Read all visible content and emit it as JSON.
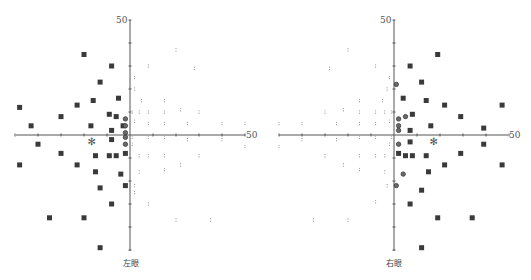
{
  "chart_data": [
    {
      "type": "scatter",
      "title": "左眼",
      "axis_max_label": "50",
      "xlim": [
        -50,
        50
      ],
      "ylim": [
        -50,
        50
      ],
      "grid": false,
      "tick_step": 10,
      "series": [
        {
          "name": "defect (filled square)",
          "marker": "square",
          "points": [
            [
              -20,
              35
            ],
            [
              -8,
              30
            ],
            [
              -13,
              23
            ],
            [
              -16,
              15
            ],
            [
              -5,
              16
            ],
            [
              -48,
              12
            ],
            [
              -23,
              13
            ],
            [
              -30,
              8
            ],
            [
              -9,
              9
            ],
            [
              -6,
              8
            ],
            [
              -43,
              4
            ],
            [
              -17,
              4
            ],
            [
              -3,
              4
            ],
            [
              -8,
              2
            ],
            [
              -8,
              -2
            ],
            [
              -40,
              -4
            ],
            [
              -30,
              -8
            ],
            [
              -15,
              -9
            ],
            [
              -9,
              -9
            ],
            [
              -6,
              -9
            ],
            [
              -2,
              -8
            ],
            [
              -48,
              -13
            ],
            [
              -23,
              -13
            ],
            [
              -15,
              -16
            ],
            [
              -4,
              -17
            ],
            [
              -2,
              -22
            ],
            [
              -13,
              -23
            ],
            [
              -8,
              -30
            ],
            [
              -35,
              -36
            ],
            [
              -20,
              -36
            ],
            [
              -13,
              -49
            ]
          ]
        },
        {
          "name": "relative defect (circle)",
          "marker": "circle",
          "points": [
            [
              -2,
              7
            ],
            [
              -2,
              4
            ],
            [
              -2,
              1
            ],
            [
              -2,
              -1
            ],
            [
              -2,
              -4
            ]
          ]
        },
        {
          "name": "normal (dot)",
          "marker": "dot",
          "points": [
            [
              20,
              37
            ],
            [
              8,
              30
            ],
            [
              28,
              29
            ],
            [
              2,
              25
            ],
            [
              2,
              20
            ],
            [
              5,
              15
            ],
            [
              15,
              15
            ],
            [
              22,
              11
            ],
            [
              1,
              10
            ],
            [
              4,
              10
            ],
            [
              8,
              10
            ],
            [
              15,
              10
            ],
            [
              30,
              10
            ],
            [
              2,
              6
            ],
            [
              8,
              5
            ],
            [
              15,
              5
            ],
            [
              25,
              5
            ],
            [
              40,
              5
            ],
            [
              50,
              5
            ],
            [
              1,
              -1
            ],
            [
              8,
              -1
            ],
            [
              15,
              -1
            ],
            [
              25,
              -2
            ],
            [
              40,
              -2
            ],
            [
              50,
              -5
            ],
            [
              1,
              -4
            ],
            [
              4,
              -9
            ],
            [
              8,
              -9
            ],
            [
              15,
              -9
            ],
            [
              30,
              -9
            ],
            [
              22,
              -13
            ],
            [
              4,
              -16
            ],
            [
              15,
              -15
            ],
            [
              2,
              -22
            ],
            [
              2,
              -25
            ],
            [
              8,
              -30
            ],
            [
              20,
              -37
            ],
            [
              35,
              -37
            ]
          ]
        },
        {
          "name": "blind spot",
          "marker": "asterisk",
          "points": [
            [
              -17,
              -3
            ]
          ]
        }
      ],
      "x_label_text": "左眼"
    },
    {
      "type": "scatter",
      "title": "右眼",
      "axis_max_label": "50",
      "xlim": [
        -50,
        50
      ],
      "ylim": [
        -50,
        50
      ],
      "grid": false,
      "tick_step": 10,
      "series": [
        {
          "name": "defect (filled square)",
          "marker": "square",
          "points": [
            [
              19,
              35
            ],
            [
              7,
              30
            ],
            [
              12,
              23
            ],
            [
              4,
              16
            ],
            [
              14,
              15
            ],
            [
              22,
              13
            ],
            [
              47,
              13
            ],
            [
              8,
              9
            ],
            [
              29,
              8
            ],
            [
              16,
              4
            ],
            [
              39,
              3
            ],
            [
              7,
              2
            ],
            [
              7,
              -3
            ],
            [
              39,
              -4
            ],
            [
              2,
              -8
            ],
            [
              5,
              -9
            ],
            [
              8,
              -9
            ],
            [
              14,
              -9
            ],
            [
              29,
              -8
            ],
            [
              22,
              -13
            ],
            [
              47,
              -13
            ],
            [
              15,
              -16
            ],
            [
              12,
              -24
            ],
            [
              7,
              -30
            ],
            [
              19,
              -36
            ],
            [
              34,
              -36
            ],
            [
              12,
              -49
            ]
          ]
        },
        {
          "name": "relative defect (circle)",
          "marker": "circle",
          "points": [
            [
              1,
              22
            ],
            [
              5,
              8
            ],
            [
              2,
              7
            ],
            [
              2,
              4
            ],
            [
              2,
              2
            ],
            [
              2,
              -4
            ],
            [
              4,
              -17
            ],
            [
              1,
              -22
            ]
          ]
        },
        {
          "name": "normal (dot)",
          "marker": "dot",
          "points": [
            [
              -20,
              37
            ],
            [
              -8,
              30
            ],
            [
              -28,
              29
            ],
            [
              -2,
              25
            ],
            [
              -3,
              20
            ],
            [
              -15,
              15
            ],
            [
              -5,
              15
            ],
            [
              -22,
              11
            ],
            [
              -1,
              10
            ],
            [
              -4,
              10
            ],
            [
              -8,
              10
            ],
            [
              -15,
              10
            ],
            [
              -30,
              10
            ],
            [
              -2,
              6
            ],
            [
              -8,
              5
            ],
            [
              -15,
              5
            ],
            [
              -25,
              5
            ],
            [
              -40,
              5
            ],
            [
              -50,
              5
            ],
            [
              -1,
              -1
            ],
            [
              -8,
              -1
            ],
            [
              -15,
              -1
            ],
            [
              -25,
              -2
            ],
            [
              -40,
              -2
            ],
            [
              -50,
              -5
            ],
            [
              -2,
              -4
            ],
            [
              -4,
              -9
            ],
            [
              -8,
              -9
            ],
            [
              -15,
              -9
            ],
            [
              -30,
              -9
            ],
            [
              -22,
              -13
            ],
            [
              -15,
              -15
            ],
            [
              -4,
              -16
            ],
            [
              -3,
              -22
            ],
            [
              -8,
              -29
            ],
            [
              -20,
              -37
            ],
            [
              -35,
              -37
            ]
          ]
        },
        {
          "name": "blind spot",
          "marker": "asterisk",
          "points": [
            [
              17,
              -3
            ]
          ]
        }
      ],
      "x_label_text": "右眼"
    }
  ],
  "charts": {
    "left": {
      "eye_label": "左眼",
      "top_label": "50",
      "right_label": "50"
    },
    "right": {
      "eye_label": "右眼",
      "top_label": "50",
      "right_label": "50"
    }
  },
  "glyphs": {
    "blind_spot": "✻"
  }
}
